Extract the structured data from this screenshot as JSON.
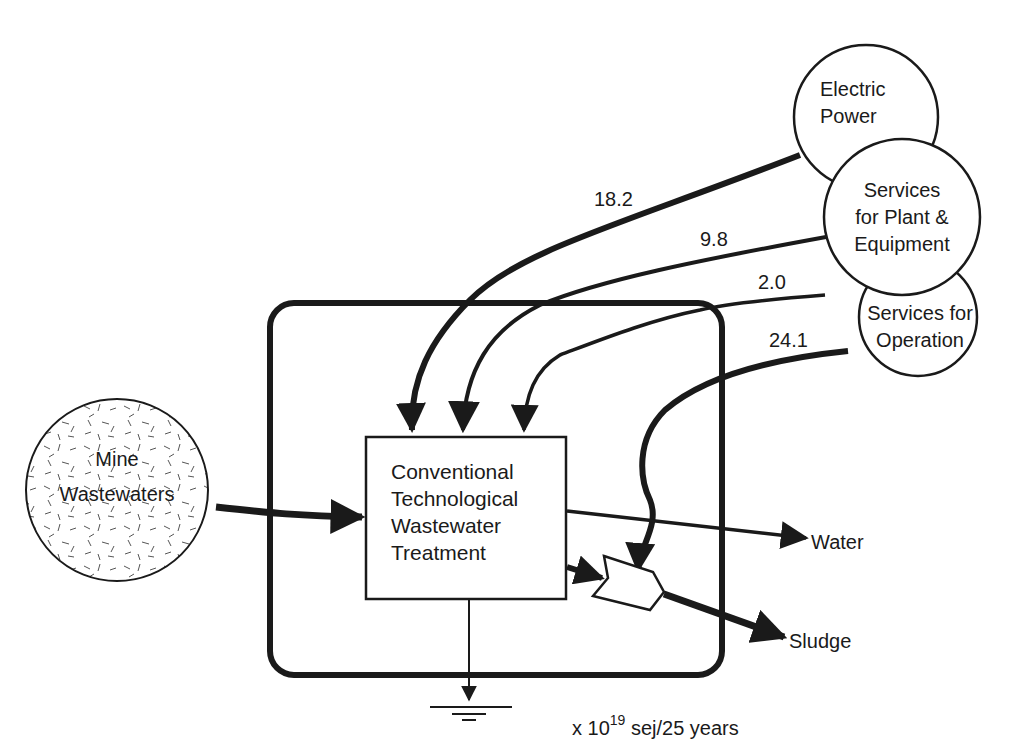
{
  "diagram": {
    "type": "emergy-flow-diagram",
    "units": {
      "prefix": "x 10",
      "exponent": "19",
      "suffix": " sej/25 years"
    },
    "sources": [
      {
        "id": "mine-wastewaters",
        "label_line1": "Mine",
        "label_line2": "Wastewaters"
      },
      {
        "id": "electric-power",
        "label_line1": "Electric",
        "label_line2": "Power"
      },
      {
        "id": "services-plant",
        "label_line1": "Services",
        "label_line2": "for Plant &",
        "label_line3": "Equipment"
      },
      {
        "id": "services-operation",
        "label_line1": "Services for",
        "label_line2": "Operation"
      }
    ],
    "process": {
      "line1": "Conventional",
      "line2": "Technological",
      "line3": "Wastewater",
      "line4": "Treatment"
    },
    "flows": [
      {
        "from": "electric-power",
        "to": "process",
        "value": "18.2"
      },
      {
        "from": "services-plant",
        "to": "process",
        "value": "9.8"
      },
      {
        "from": "services-operation",
        "to": "process",
        "value": "2.0"
      },
      {
        "from": "services-operation",
        "to": "sludge-interaction",
        "value": "24.1"
      }
    ],
    "outputs": {
      "water": "Water",
      "sludge": "Sludge"
    }
  }
}
